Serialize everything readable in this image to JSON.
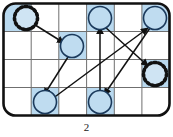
{
  "figure": {
    "caption": "2",
    "title": "",
    "board": {
      "columns": 6,
      "rows": 4,
      "border_color": "#111111",
      "grid_line_color": "#6f6f6f",
      "background_color": "#ffffff",
      "shaded_cell_color": "#b9d9ef",
      "corner_radius": 12
    },
    "shaded_cells": [
      {
        "row": 1,
        "col": 1
      },
      {
        "row": 1,
        "col": 4
      },
      {
        "row": 1,
        "col": 6
      },
      {
        "row": 2,
        "col": 3
      },
      {
        "row": 3,
        "col": 6
      },
      {
        "row": 4,
        "col": 2
      },
      {
        "row": 4,
        "col": 4
      }
    ],
    "nodes": [
      {
        "id": "n1",
        "row": 1,
        "col": 1,
        "shape": "spiky-circle",
        "label": "",
        "fill": "#cfe4f3",
        "stroke": "#111111"
      },
      {
        "id": "n2",
        "row": 1,
        "col": 4,
        "shape": "circle",
        "label": "",
        "fill": "#bfdcf0",
        "stroke": "#1b3a5c"
      },
      {
        "id": "n3",
        "row": 1,
        "col": 6,
        "shape": "circle",
        "label": "",
        "fill": "#bfdcf0",
        "stroke": "#1b3a5c"
      },
      {
        "id": "n4",
        "row": 2,
        "col": 3,
        "shape": "circle",
        "label": "",
        "fill": "#bfdcf0",
        "stroke": "#1b3a5c"
      },
      {
        "id": "n5",
        "row": 3,
        "col": 6,
        "shape": "spiky-circle",
        "label": "",
        "fill": "#cfe4f3",
        "stroke": "#111111"
      },
      {
        "id": "n6",
        "row": 4,
        "col": 2,
        "shape": "circle",
        "label": "",
        "fill": "#bfdcf0",
        "stroke": "#1b3a5c"
      },
      {
        "id": "n7",
        "row": 4,
        "col": 4,
        "shape": "circle",
        "label": "",
        "fill": "#bfdcf0",
        "stroke": "#1b3a5c"
      }
    ],
    "edges": [
      {
        "id": "e1",
        "from": "n1",
        "to": "n4",
        "label": "",
        "color": "#111111"
      },
      {
        "id": "e2",
        "from": "n4",
        "to": "n6",
        "label": "",
        "color": "#111111"
      },
      {
        "id": "e3",
        "from": "n6",
        "to": "n3",
        "label": "",
        "color": "#111111"
      },
      {
        "id": "e4",
        "from": "n2",
        "to": "n5",
        "label": "",
        "color": "#111111"
      },
      {
        "id": "e5",
        "from": "n3",
        "to": "n7",
        "label": "",
        "color": "#111111"
      },
      {
        "id": "e6",
        "from": "n7",
        "to": "n2",
        "label": "",
        "color": "#111111"
      }
    ]
  }
}
